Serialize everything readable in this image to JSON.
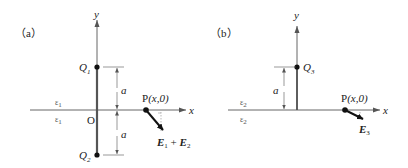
{
  "panels": [
    {
      "id": "a",
      "label": "（a）",
      "axis_x_label": "x",
      "axis_y_label": "y",
      "origin_label": "O",
      "medium_upper": "ε",
      "medium_upper_sub": "1",
      "medium_lower": "ε",
      "medium_lower_sub": "1",
      "charges": [
        {
          "name": "Q",
          "sub": "1",
          "position": "(0, a)"
        },
        {
          "name": "Q",
          "sub": "2",
          "position": "(0, -a)"
        }
      ],
      "distance_upper": "a",
      "distance_lower": "a",
      "point_label": "P",
      "point_coords": "(x,0)",
      "field_label": {
        "e1": "E",
        "e1_sub": "1",
        "plus": " + ",
        "e2": "E",
        "e2_sub": "2"
      }
    },
    {
      "id": "b",
      "label": "（b）",
      "axis_x_label": "x",
      "axis_y_label": "y",
      "medium_upper": "ε",
      "medium_upper_sub": "2",
      "medium_lower": "ε",
      "medium_lower_sub": "2",
      "charges": [
        {
          "name": "Q",
          "sub": "3",
          "position": "(0, a)"
        }
      ],
      "distance": "a",
      "point_label": "P",
      "point_coords": "(x,0)",
      "field_label": {
        "e": "E",
        "e_sub": "3"
      }
    }
  ],
  "colors": {
    "line": "#555555",
    "dark": "#111111",
    "dashed": "#999999"
  }
}
